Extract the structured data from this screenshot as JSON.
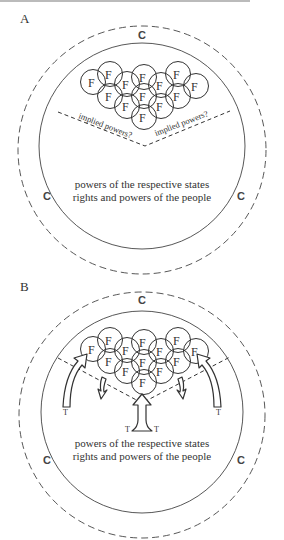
{
  "header_fragment": "FORMATION OF THE FEDERAL CONSTITUTION",
  "panels": [
    {
      "label": "A",
      "outer_label": "C",
      "left_label": "C",
      "right_label": "C",
      "federal_powers": [
        "F",
        "F",
        "F",
        "F",
        "F",
        "F",
        "F",
        "F",
        "F",
        "F",
        "F",
        "F",
        "F"
      ],
      "implied_left": "implied powers?",
      "implied_right": "implied powers?",
      "caption_line1": "powers of the respective states",
      "caption_line2": "rights and powers of the people"
    },
    {
      "label": "B",
      "outer_label": "C",
      "left_label": "C",
      "right_label": "C",
      "federal_powers": [
        "F",
        "F",
        "F",
        "F",
        "F",
        "F",
        "F",
        "F",
        "F",
        "F",
        "F",
        "F",
        "F"
      ],
      "arrow_labels": [
        "T",
        "T",
        "T",
        "T"
      ],
      "caption_line1": "powers of the respective states",
      "caption_line2": "rights and powers of the people"
    }
  ]
}
